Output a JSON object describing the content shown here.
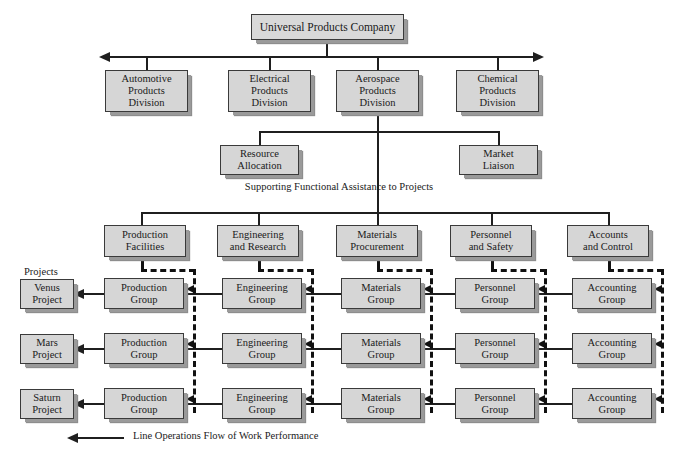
{
  "diagram": {
    "top_box": {
      "label": "Universal Products Company"
    },
    "divisions": [
      {
        "label": "Automotive\nProducts\nDivision"
      },
      {
        "label": "Electrical\nProducts\nDivision"
      },
      {
        "label": "Aerospace\nProducts\nDivision"
      },
      {
        "label": "Chemical\nProducts\nDivision"
      }
    ],
    "staff": [
      {
        "label": "Resource\nAllocation"
      },
      {
        "label": "Market\nLiaison"
      }
    ],
    "support_caption": "Supporting Functional Assistance to Projects",
    "functions": [
      {
        "label": "Production\nFacilities"
      },
      {
        "label": "Engineering\nand Research"
      },
      {
        "label": "Materials\nProcurement"
      },
      {
        "label": "Personnel\nand Safety"
      },
      {
        "label": "Accounts\nand Control"
      }
    ],
    "projects_caption": "Projects",
    "projects": [
      {
        "label": "Venus\nProject"
      },
      {
        "label": "Mars\nProject"
      },
      {
        "label": "Saturn\nProject"
      }
    ],
    "group_columns": [
      "Production\nGroup",
      "Engineering\nGroup",
      "Materials\nGroup",
      "Personnel\nGroup",
      "Accounting\nGroup"
    ],
    "groups": [
      [
        {
          "label": "Production\nGroup"
        },
        {
          "label": "Engineering\nGroup"
        },
        {
          "label": "Materials\nGroup"
        },
        {
          "label": "Personnel\nGroup"
        },
        {
          "label": "Accounting\nGroup"
        }
      ],
      [
        {
          "label": "Production\nGroup"
        },
        {
          "label": "Engineering\nGroup"
        },
        {
          "label": "Materials\nGroup"
        },
        {
          "label": "Personnel\nGroup"
        },
        {
          "label": "Accounting\nGroup"
        }
      ],
      [
        {
          "label": "Production\nGroup"
        },
        {
          "label": "Engineering\nGroup"
        },
        {
          "label": "Materials\nGroup"
        },
        {
          "label": "Personnel\nGroup"
        },
        {
          "label": "Accounting\nGroup"
        }
      ]
    ],
    "legend": {
      "label": "Line Operations Flow of Work Performance"
    },
    "colors": {
      "box_fill": "#d6d6d6",
      "box_border": "#3a3a3a",
      "shadow": "#9a9a9a",
      "line": "#1f1f1f",
      "dashed_line": "#111111",
      "background": "#ffffff",
      "text": "#1a1a1a"
    }
  }
}
